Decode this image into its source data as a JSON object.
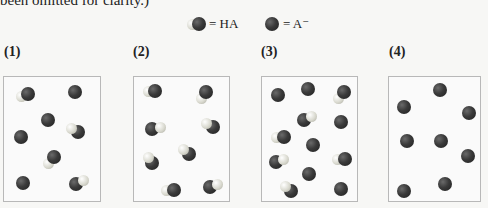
{
  "text": {
    "top_line": "been omitted for clarity.)"
  },
  "legend": {
    "ha_label": "= HA",
    "a_label": "= A⁻",
    "ha_icon": "ha-molecule-icon",
    "a_icon": "a-minus-ion-icon"
  },
  "panels": [
    {
      "label": "(1)",
      "box": {
        "x": 3,
        "w": 98
      },
      "particles": [
        {
          "type": "HA",
          "x": 28,
          "y": 94,
          "hdx": -7,
          "hdy": 2
        },
        {
          "type": "A",
          "x": 75,
          "y": 92
        },
        {
          "type": "A",
          "x": 48,
          "y": 120
        },
        {
          "type": "HA",
          "x": 78,
          "y": 132,
          "hdx": -7,
          "hdy": -4
        },
        {
          "type": "A",
          "x": 21,
          "y": 137
        },
        {
          "type": "HA",
          "x": 54,
          "y": 157,
          "hdx": -6,
          "hdy": 6
        },
        {
          "type": "A",
          "x": 23,
          "y": 183
        },
        {
          "type": "HA",
          "x": 76,
          "y": 184,
          "hdx": 7,
          "hdy": -4
        }
      ]
    },
    {
      "label": "(2)",
      "box": {
        "x": 133,
        "w": 97
      },
      "particles": [
        {
          "type": "HA",
          "x": 155,
          "y": 91,
          "hdx": -7,
          "hdy": 0
        },
        {
          "type": "HA",
          "x": 206,
          "y": 92,
          "hdx": -5,
          "hdy": 6
        },
        {
          "type": "HA",
          "x": 152,
          "y": 129,
          "hdx": 8,
          "hdy": -2
        },
        {
          "type": "HA",
          "x": 213,
          "y": 127,
          "hdx": -7,
          "hdy": -4
        },
        {
          "type": "HA",
          "x": 189,
          "y": 154,
          "hdx": -6,
          "hdy": -5
        },
        {
          "type": "HA",
          "x": 152,
          "y": 163,
          "hdx": -4,
          "hdy": -6
        },
        {
          "type": "HA",
          "x": 174,
          "y": 190,
          "hdx": -8,
          "hdy": 0
        },
        {
          "type": "HA",
          "x": 210,
          "y": 187,
          "hdx": 7,
          "hdy": -3
        }
      ]
    },
    {
      "label": "(3)",
      "box": {
        "x": 261,
        "w": 97
      },
      "particles": [
        {
          "type": "A",
          "x": 278,
          "y": 95
        },
        {
          "type": "A",
          "x": 308,
          "y": 89
        },
        {
          "type": "HA",
          "x": 344,
          "y": 92,
          "hdx": -6,
          "hdy": 6
        },
        {
          "type": "HA",
          "x": 304,
          "y": 120,
          "hdx": 7,
          "hdy": -4
        },
        {
          "type": "A",
          "x": 341,
          "y": 122
        },
        {
          "type": "HA",
          "x": 284,
          "y": 137,
          "hdx": -8,
          "hdy": 0
        },
        {
          "type": "A",
          "x": 313,
          "y": 145
        },
        {
          "type": "HA",
          "x": 276,
          "y": 162,
          "hdx": 7,
          "hdy": -3
        },
        {
          "type": "HA",
          "x": 345,
          "y": 159,
          "hdx": -8,
          "hdy": 0
        },
        {
          "type": "A",
          "x": 309,
          "y": 174
        },
        {
          "type": "HA",
          "x": 291,
          "y": 191,
          "hdx": -6,
          "hdy": -5
        },
        {
          "type": "A",
          "x": 341,
          "y": 189
        }
      ]
    },
    {
      "label": "(4)",
      "box": {
        "x": 388,
        "w": 93
      },
      "particles": [
        {
          "type": "A",
          "x": 440,
          "y": 90
        },
        {
          "type": "A",
          "x": 404,
          "y": 107
        },
        {
          "type": "A",
          "x": 469,
          "y": 113
        },
        {
          "type": "A",
          "x": 407,
          "y": 141
        },
        {
          "type": "A",
          "x": 441,
          "y": 141
        },
        {
          "type": "A",
          "x": 468,
          "y": 156
        },
        {
          "type": "A",
          "x": 404,
          "y": 191
        },
        {
          "type": "A",
          "x": 445,
          "y": 184
        }
      ]
    }
  ]
}
